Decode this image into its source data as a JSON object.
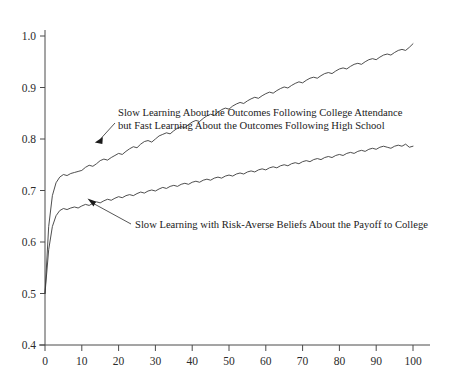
{
  "chart_data": {
    "type": "line",
    "title": "",
    "subtitle": "",
    "xlabel": "",
    "ylabel": "",
    "xlim": [
      0,
      100
    ],
    "ylim": [
      0.4,
      1.0
    ],
    "grid": false,
    "legend_position": "none",
    "x_ticks": [
      0,
      10,
      20,
      30,
      40,
      50,
      60,
      70,
      80,
      90,
      100
    ],
    "x_tick_labels": [
      "0",
      "10",
      "20",
      "30",
      "40",
      "50",
      "60",
      "70",
      "80",
      "90",
      "100"
    ],
    "y_ticks": [
      0.4,
      0.5,
      0.6,
      0.7,
      0.8,
      0.9,
      1.0
    ],
    "y_tick_labels": [
      "0.4",
      "0.5",
      "0.6",
      "0.7",
      "0.8",
      "0.9",
      "1.0"
    ],
    "series": [
      {
        "name": "Slow Learning About the Outcomes Following College Attendance but Fast Learning About the Outcomes Following High School",
        "color": "#3a3a3a",
        "x": [
          0,
          1,
          2,
          3,
          4,
          5,
          6,
          7,
          8,
          9,
          10,
          11,
          12,
          13,
          14,
          15,
          16,
          17,
          18,
          19,
          20,
          21,
          22,
          23,
          24,
          25,
          26,
          27,
          28,
          29,
          30,
          31,
          32,
          33,
          34,
          35,
          36,
          37,
          38,
          39,
          40,
          41,
          42,
          43,
          44,
          45,
          46,
          47,
          48,
          49,
          50,
          51,
          52,
          53,
          54,
          55,
          56,
          57,
          58,
          59,
          60,
          61,
          62,
          63,
          64,
          65,
          66,
          67,
          68,
          69,
          70,
          71,
          72,
          73,
          74,
          75,
          76,
          77,
          78,
          79,
          80,
          81,
          82,
          83,
          84,
          85,
          86,
          87,
          88,
          89,
          90,
          91,
          92,
          93,
          94,
          95,
          96,
          97,
          98,
          99,
          100
        ],
        "y": [
          0.5,
          0.63,
          0.69,
          0.715,
          0.726,
          0.731,
          0.729,
          0.733,
          0.735,
          0.737,
          0.739,
          0.745,
          0.749,
          0.747,
          0.752,
          0.758,
          0.761,
          0.759,
          0.764,
          0.768,
          0.772,
          0.77,
          0.776,
          0.781,
          0.785,
          0.783,
          0.79,
          0.795,
          0.797,
          0.794,
          0.8,
          0.806,
          0.809,
          0.812,
          0.81,
          0.816,
          0.821,
          0.824,
          0.822,
          0.828,
          0.833,
          0.836,
          0.834,
          0.84,
          0.845,
          0.848,
          0.846,
          0.852,
          0.857,
          0.86,
          0.858,
          0.864,
          0.868,
          0.871,
          0.869,
          0.874,
          0.878,
          0.881,
          0.879,
          0.884,
          0.888,
          0.891,
          0.889,
          0.894,
          0.898,
          0.901,
          0.899,
          0.904,
          0.908,
          0.911,
          0.909,
          0.914,
          0.918,
          0.92,
          0.918,
          0.923,
          0.927,
          0.929,
          0.927,
          0.932,
          0.936,
          0.938,
          0.936,
          0.941,
          0.945,
          0.947,
          0.945,
          0.95,
          0.954,
          0.956,
          0.954,
          0.959,
          0.963,
          0.965,
          0.963,
          0.968,
          0.972,
          0.974,
          0.972,
          0.978,
          0.985
        ]
      },
      {
        "name": "Slow Learning with Risk-Averse Beliefs About the Payoff to College",
        "color": "#3a3a3a",
        "x": [
          0,
          1,
          2,
          3,
          4,
          5,
          6,
          7,
          8,
          9,
          10,
          11,
          12,
          13,
          14,
          15,
          16,
          17,
          18,
          19,
          20,
          21,
          22,
          23,
          24,
          25,
          26,
          27,
          28,
          29,
          30,
          31,
          32,
          33,
          34,
          35,
          36,
          37,
          38,
          39,
          40,
          41,
          42,
          43,
          44,
          45,
          46,
          47,
          48,
          49,
          50,
          51,
          52,
          53,
          54,
          55,
          56,
          57,
          58,
          59,
          60,
          61,
          62,
          63,
          64,
          65,
          66,
          67,
          68,
          69,
          70,
          71,
          72,
          73,
          74,
          75,
          76,
          77,
          78,
          79,
          80,
          81,
          82,
          83,
          84,
          85,
          86,
          87,
          88,
          89,
          90,
          91,
          92,
          93,
          94,
          95,
          96,
          97,
          98,
          99,
          100
        ],
        "y": [
          0.5,
          0.585,
          0.63,
          0.651,
          0.661,
          0.665,
          0.663,
          0.666,
          0.668,
          0.666,
          0.67,
          0.673,
          0.671,
          0.675,
          0.678,
          0.676,
          0.68,
          0.683,
          0.681,
          0.685,
          0.688,
          0.686,
          0.69,
          0.692,
          0.69,
          0.694,
          0.697,
          0.695,
          0.699,
          0.701,
          0.699,
          0.703,
          0.706,
          0.704,
          0.708,
          0.71,
          0.708,
          0.712,
          0.714,
          0.712,
          0.716,
          0.718,
          0.716,
          0.72,
          0.722,
          0.72,
          0.724,
          0.726,
          0.724,
          0.728,
          0.73,
          0.728,
          0.732,
          0.734,
          0.732,
          0.736,
          0.738,
          0.736,
          0.74,
          0.742,
          0.74,
          0.744,
          0.746,
          0.744,
          0.748,
          0.75,
          0.748,
          0.752,
          0.754,
          0.752,
          0.756,
          0.758,
          0.756,
          0.76,
          0.762,
          0.76,
          0.764,
          0.766,
          0.764,
          0.768,
          0.77,
          0.768,
          0.772,
          0.774,
          0.772,
          0.776,
          0.778,
          0.776,
          0.78,
          0.782,
          0.78,
          0.784,
          0.786,
          0.784,
          0.782,
          0.786,
          0.788,
          0.786,
          0.79,
          0.784,
          0.786
        ]
      }
    ],
    "annotations": [
      {
        "id": "upper-annotation",
        "lines": [
          "Slow Learning About the Outcomes Following College Attendance",
          "but Fast Learning About the Outcomes Following High School"
        ],
        "points_to_x": 13,
        "points_to_y": 0.793
      },
      {
        "id": "lower-annotation",
        "lines": [
          "Slow Learning with Risk-Averse Beliefs About the Payoff to College"
        ],
        "points_to_x": 11,
        "points_to_y": 0.7
      }
    ]
  }
}
